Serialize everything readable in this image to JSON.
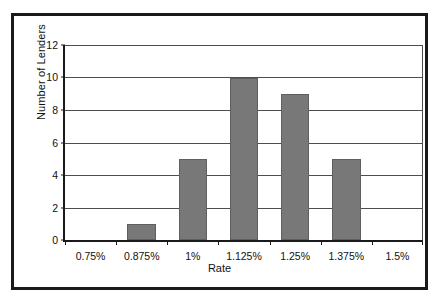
{
  "chart_data": {
    "type": "bar",
    "title": "",
    "xlabel": "Rate",
    "ylabel": "Number of Lenders",
    "categories": [
      "0.75%",
      "0.875%",
      "1%",
      "1.125%",
      "1.25%",
      "1.375%",
      "1.5%"
    ],
    "values": [
      0,
      1,
      5,
      10,
      9,
      5,
      0
    ],
    "ylim": [
      0,
      12
    ],
    "ytick_labels": [
      "12",
      "10",
      "8",
      "6",
      "4",
      "2",
      "0"
    ],
    "ytick_values": [
      12,
      10,
      8,
      6,
      4,
      2,
      0
    ],
    "grid": "horizontal",
    "legend": "none",
    "bar_color": "#787878",
    "axis_color": "#1a1a1a",
    "gridline_color": "#4d4d4d",
    "plot_background": "#ffffff"
  },
  "frame": {
    "border_color": "#1a1a1a"
  }
}
